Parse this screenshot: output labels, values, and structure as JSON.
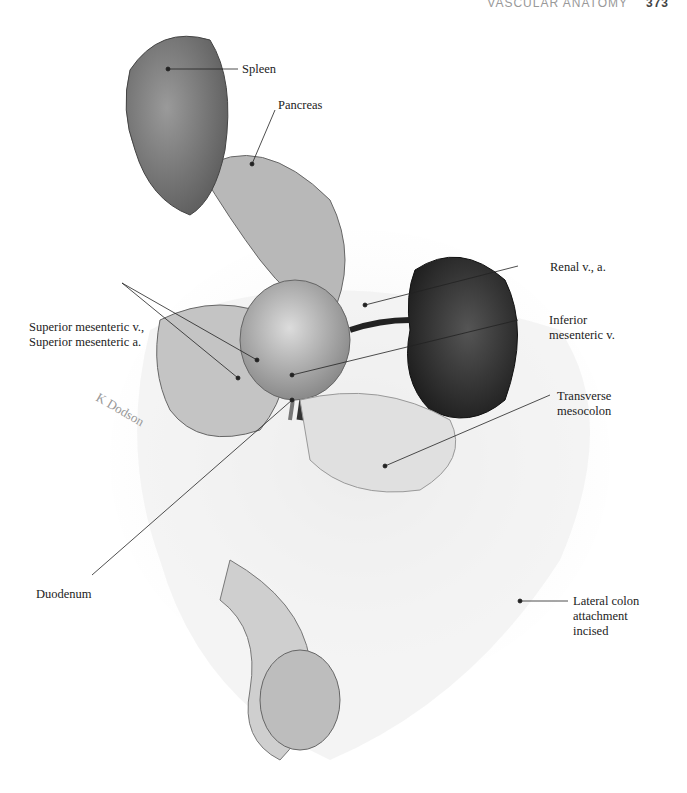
{
  "header": {
    "running_title": "VASCULAR ANATOMY",
    "page_number": "373"
  },
  "figure": {
    "labels": {
      "spleen": "Spleen",
      "pancreas": "Pancreas",
      "renal": "Renal v., a.",
      "inferior_mesenteric_1": "Inferior",
      "inferior_mesenteric_2": "mesenteric v.",
      "superior_mesenteric_1": "Superior mesenteric v.,",
      "superior_mesenteric_2": "Superior mesenteric a.",
      "transverse_1": "Transverse",
      "transverse_2": "mesocolon",
      "duodenum": "Duodenum",
      "lateral_1": "Lateral colon",
      "lateral_2": "attachment",
      "lateral_3": "incised"
    },
    "signature": "K Dodson"
  }
}
